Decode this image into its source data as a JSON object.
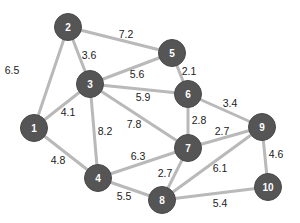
{
  "diagram": {
    "type": "weighted-undirected-graph",
    "colors": {
      "node_fill": "#555555",
      "edge": "#b9b9b9",
      "node_text": "#ffffff",
      "weight_text": "#222222",
      "background": "#ffffff"
    },
    "nodes": [
      {
        "id": "1",
        "label": "1",
        "x": 34,
        "y": 128
      },
      {
        "id": "2",
        "label": "2",
        "x": 68,
        "y": 27
      },
      {
        "id": "3",
        "label": "3",
        "x": 90,
        "y": 84
      },
      {
        "id": "4",
        "label": "4",
        "x": 98,
        "y": 178
      },
      {
        "id": "5",
        "label": "5",
        "x": 172,
        "y": 53
      },
      {
        "id": "6",
        "label": "6",
        "x": 188,
        "y": 94
      },
      {
        "id": "7",
        "label": "7",
        "x": 188,
        "y": 148
      },
      {
        "id": "8",
        "label": "8",
        "x": 162,
        "y": 200
      },
      {
        "id": "9",
        "label": "9",
        "x": 262,
        "y": 127
      },
      {
        "id": "10",
        "label": "10",
        "x": 268,
        "y": 187
      }
    ],
    "edges": [
      {
        "from": "1",
        "to": "2",
        "weight": "6.5",
        "lx": 12,
        "ly": 70
      },
      {
        "from": "1",
        "to": "3",
        "weight": "4.1",
        "lx": 68,
        "ly": 112
      },
      {
        "from": "1",
        "to": "4",
        "weight": "4.8",
        "lx": 58,
        "ly": 160
      },
      {
        "from": "2",
        "to": "3",
        "weight": "3.6",
        "lx": 89,
        "ly": 55
      },
      {
        "from": "2",
        "to": "5",
        "weight": "7.2",
        "lx": 126,
        "ly": 34
      },
      {
        "from": "3",
        "to": "5",
        "weight": "5.6",
        "lx": 137,
        "ly": 74
      },
      {
        "from": "3",
        "to": "6",
        "weight": "5.9",
        "lx": 143,
        "ly": 97
      },
      {
        "from": "3",
        "to": "7",
        "weight": "7.8",
        "lx": 134,
        "ly": 124
      },
      {
        "from": "3",
        "to": "4",
        "weight": "8.2",
        "lx": 105,
        "ly": 131
      },
      {
        "from": "5",
        "to": "6",
        "weight": "2.1",
        "lx": 189,
        "ly": 71
      },
      {
        "from": "6",
        "to": "7",
        "weight": "2.8",
        "lx": 199,
        "ly": 120
      },
      {
        "from": "6",
        "to": "9",
        "weight": "3.4",
        "lx": 230,
        "ly": 103
      },
      {
        "from": "7",
        "to": "9",
        "weight": "2.7",
        "lx": 222,
        "ly": 131
      },
      {
        "from": "4",
        "to": "7",
        "weight": "6.3",
        "lx": 138,
        "ly": 156
      },
      {
        "from": "7",
        "to": "8",
        "weight": "2.7",
        "lx": 165,
        "ly": 173
      },
      {
        "from": "4",
        "to": "8",
        "weight": "5.5",
        "lx": 124,
        "ly": 196
      },
      {
        "from": "8",
        "to": "9",
        "weight": "6.1",
        "lx": 220,
        "ly": 168
      },
      {
        "from": "8",
        "to": "10",
        "weight": "5.4",
        "lx": 220,
        "ly": 203
      },
      {
        "from": "9",
        "to": "10",
        "weight": "4.6",
        "lx": 276,
        "ly": 154
      }
    ]
  }
}
